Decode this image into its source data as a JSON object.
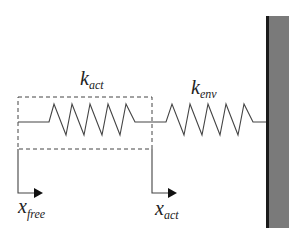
{
  "diagram": {
    "labels": {
      "k_act": {
        "main": "k",
        "sub": "act"
      },
      "k_env": {
        "main": "k",
        "sub": "env"
      },
      "x_free": {
        "main": "x",
        "sub": "free"
      },
      "x_act": {
        "main": "x",
        "sub": "act"
      }
    },
    "components": [
      {
        "id": "actuator-spring",
        "label": "k_act",
        "enclosed_in_dashed_box": true
      },
      {
        "id": "environment-spring",
        "label": "k_env"
      },
      {
        "id": "wall",
        "type": "rigid-environment"
      }
    ],
    "displacements": [
      {
        "id": "x_free",
        "direction": "right"
      },
      {
        "id": "x_act",
        "direction": "right"
      }
    ],
    "colors": {
      "line": "#444444",
      "wall_fill": "#7a7a7a",
      "wall_edge": "#1a1a1a",
      "background": "#ffffff"
    }
  }
}
